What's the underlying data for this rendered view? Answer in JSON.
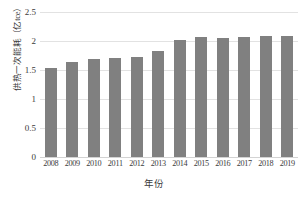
{
  "chart_data": {
    "type": "bar",
    "title": "",
    "subtitle": "",
    "xlabel": "年份",
    "ylabel": "供热一次能耗（亿tce）",
    "categories": [
      "2008",
      "2009",
      "2010",
      "2011",
      "2012",
      "2013",
      "2014",
      "2015",
      "2016",
      "2017",
      "2018",
      "2019"
    ],
    "values": [
      1.54,
      1.64,
      1.69,
      1.71,
      1.73,
      1.83,
      2.02,
      2.07,
      2.06,
      2.07,
      2.08,
      2.09
    ],
    "series": [
      {
        "name": "供热一次能耗",
        "values": [
          1.54,
          1.64,
          1.69,
          1.71,
          1.73,
          1.83,
          2.02,
          2.07,
          2.06,
          2.07,
          2.08,
          2.09
        ]
      }
    ],
    "ylim": [
      0,
      2.5
    ],
    "y_ticks": [
      "0",
      "0.5",
      "1",
      "1.5",
      "2",
      "2.5"
    ],
    "y_tick_values": [
      0,
      0.5,
      1,
      1.5,
      2,
      2.5
    ],
    "grid": true,
    "legend": false,
    "legend_position": "none",
    "bar_color": "#808080",
    "gridline_color": "#e2e2e2",
    "background_color": "#ffffff"
  }
}
